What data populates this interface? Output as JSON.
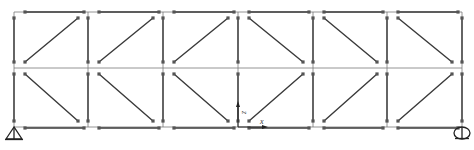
{
  "diagram": {
    "type": "structural truss frame (2 rows x 6 panels, bar elements with end nodes)",
    "colors": {
      "line": "#3a3a3a",
      "thin_line": "#7a7a7a",
      "node": "#555555",
      "background": "#ffffff"
    },
    "grid": {
      "columns_x": [
        14,
        88,
        163,
        238,
        313,
        387,
        462
      ],
      "rows_y": [
        12,
        68,
        127
      ]
    },
    "panels": {
      "top_row_diagonal": [
        "ascending",
        "ascending",
        "ascending",
        "descending",
        "descending",
        "descending"
      ],
      "bottom_row_diagonal": [
        "descending",
        "descending",
        "descending",
        "ascending",
        "ascending",
        "ascending"
      ]
    },
    "supports": [
      {
        "type": "pin",
        "symbol": "triangle",
        "x": 14,
        "y": 127
      },
      {
        "type": "roller",
        "symbol": "circle",
        "x": 462,
        "y": 127
      }
    ],
    "axes": {
      "origin": {
        "x": 238,
        "y": 127
      },
      "x_label": "x",
      "z_label": "z"
    }
  }
}
